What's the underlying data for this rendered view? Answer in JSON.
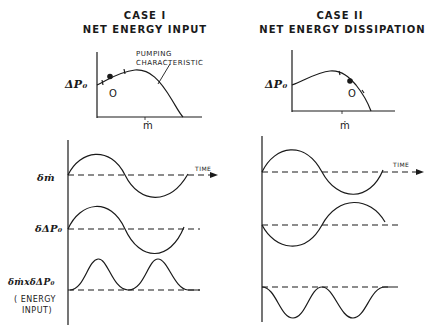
{
  "case1": {
    "title": "CASE I",
    "subtitle": "NET ENERGY INPUT",
    "curve_label_line1": "PUMPING",
    "curve_label_line2": "CHARACTERISTIC",
    "y_axis_label": "ΔP₀",
    "x_axis_label": "ṁ",
    "operating_point_label": "O",
    "slope": "positive",
    "rows": [
      {
        "label": "δṁ"
      },
      {
        "label": "δΔP₀"
      },
      {
        "label": "δṁxδΔP₀"
      }
    ],
    "product_note_line1": "( ENERGY",
    "product_note_line2": "INPUT)",
    "time_label": "TIME"
  },
  "case2": {
    "title": "CASE II",
    "subtitle": "NET ENERGY DISSIPATION",
    "y_axis_label": "ΔP₀",
    "x_axis_label": "ṁ",
    "operating_point_label": "O",
    "slope": "negative",
    "time_label": "TIME"
  },
  "colors": {
    "ink": "#1a1a1a",
    "background": "#ffffff"
  }
}
